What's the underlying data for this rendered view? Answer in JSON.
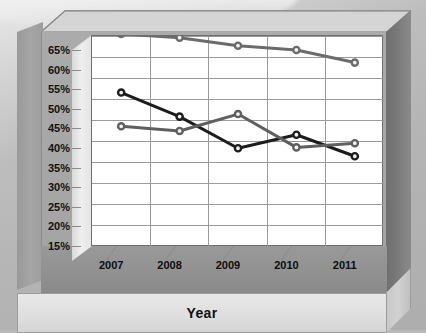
{
  "chart_data": {
    "type": "line",
    "title": "",
    "subtitle": "",
    "xlabel": "Year",
    "ylabel": "",
    "categories": [
      "2007",
      "2008",
      "2009",
      "2010",
      "2011"
    ],
    "ylim": [
      15,
      65
    ],
    "ytick_step": 5,
    "ytick_labels": [
      "65%",
      "60%",
      "55%",
      "50%",
      "45%",
      "40%",
      "35%",
      "30%",
      "25%",
      "20%",
      "15%"
    ],
    "ytick_values": [
      65,
      60,
      55,
      50,
      45,
      40,
      35,
      30,
      25,
      20,
      15
    ],
    "grid": true,
    "grid_axis": "both",
    "legend": false,
    "legend_position": "none",
    "value_unit": "%",
    "series": [
      {
        "name": "series-1-top",
        "color": "#6b6b6b",
        "marker": "circle-open",
        "values": [
          65.5,
          64.6,
          62.7,
          61.7,
          58.7
        ]
      },
      {
        "name": "series-2-dark",
        "color": "#1c1c1c",
        "marker": "circle-open",
        "values": [
          51.6,
          45.9,
          38.4,
          41.6,
          36.5
        ]
      },
      {
        "name": "series-3-gray",
        "color": "#5f5f5f",
        "marker": "circle-open",
        "values": [
          43.6,
          42.5,
          46.5,
          38.6,
          39.6
        ]
      }
    ]
  },
  "axis_title": {
    "text": "Year"
  }
}
